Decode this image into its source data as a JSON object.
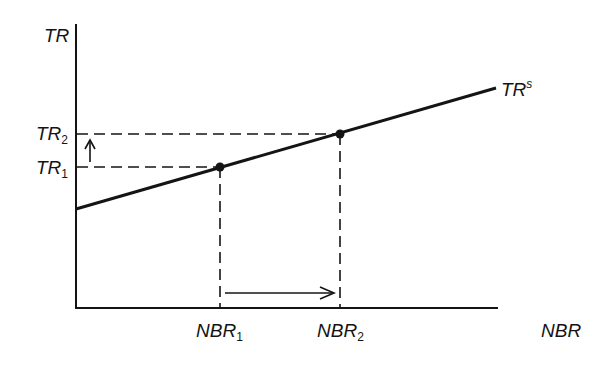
{
  "diagram": {
    "type": "economics-supply-line",
    "axes": {
      "y_label": "TR",
      "x_label": "NBR"
    },
    "curve": {
      "label_main": "TR",
      "label_sup": "s"
    },
    "points": [
      {
        "name": "point-1",
        "x_label_main": "NBR",
        "x_label_sub": "1",
        "y_label_main": "TR",
        "y_label_sub": "1"
      },
      {
        "name": "point-2",
        "x_label_main": "NBR",
        "x_label_sub": "2",
        "y_label_main": "TR",
        "y_label_sub": "2"
      }
    ],
    "arrows": {
      "vertical": "TR1 to TR2 (increase)",
      "horizontal": "NBR1 to NBR2 (increase)"
    },
    "colors": {
      "ink": "#141414",
      "background": "#ffffff"
    }
  }
}
